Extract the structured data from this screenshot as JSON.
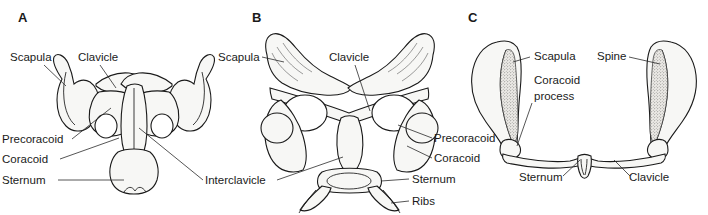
{
  "figure": {
    "background_color": "#ffffff",
    "ink_color": "#1a1a1a",
    "width": 708,
    "height": 215,
    "caption": ""
  },
  "panels": [
    {
      "id": "A",
      "letter": "A",
      "letter_pos": {
        "x": 18,
        "y": 22
      },
      "labels": [
        {
          "name": "scapula",
          "text": "Scapula",
          "x": 10,
          "y": 61,
          "anchor": "start"
        },
        {
          "name": "clavicle",
          "text": "Clavicle",
          "x": 78,
          "y": 61,
          "anchor": "start"
        },
        {
          "name": "precoracoid",
          "text": "Precoracoid",
          "x": 2,
          "y": 143,
          "anchor": "start"
        },
        {
          "name": "coracoid",
          "text": "Coracoid",
          "x": 2,
          "y": 163,
          "anchor": "start"
        },
        {
          "name": "sternum",
          "text": "Sternum",
          "x": 2,
          "y": 184,
          "anchor": "start"
        },
        {
          "name": "interclavicle",
          "text": "Interclavicle",
          "x": 205,
          "y": 184,
          "anchor": "start"
        }
      ]
    },
    {
      "id": "B",
      "letter": "B",
      "letter_pos": {
        "x": 252,
        "y": 22
      },
      "labels": [
        {
          "name": "scapula",
          "text": "Scapula",
          "x": 218,
          "y": 61,
          "anchor": "start"
        },
        {
          "name": "clavicle",
          "text": "Clavicle",
          "x": 329,
          "y": 61,
          "anchor": "start"
        },
        {
          "name": "precoracoid",
          "text": "Precoracoid",
          "x": 434,
          "y": 142,
          "anchor": "start"
        },
        {
          "name": "coracoid",
          "text": "Coracoid",
          "x": 434,
          "y": 162,
          "anchor": "start"
        },
        {
          "name": "sternum",
          "text": "Sternum",
          "x": 412,
          "y": 183,
          "anchor": "start"
        },
        {
          "name": "ribs",
          "text": "Ribs",
          "x": 412,
          "y": 205,
          "anchor": "start"
        },
        {
          "name": "interclavicle",
          "text": "Interclavicle",
          "x": 205,
          "y": 184,
          "anchor": "start"
        }
      ]
    },
    {
      "id": "C",
      "letter": "C",
      "letter_pos": {
        "x": 468,
        "y": 22
      },
      "labels": [
        {
          "name": "scapula",
          "text": "Scapula",
          "x": 534,
          "y": 60,
          "anchor": "start"
        },
        {
          "name": "spine",
          "text": "Spine",
          "x": 597,
          "y": 60,
          "anchor": "start"
        },
        {
          "name": "coracoid-process",
          "text": "Coracoid",
          "x": 534,
          "y": 84,
          "anchor": "start"
        },
        {
          "name": "coracoid-process-line2",
          "text": "process",
          "x": 534,
          "y": 100,
          "anchor": "start"
        },
        {
          "name": "sternum",
          "text": "Sternum",
          "x": 519,
          "y": 181,
          "anchor": "start"
        },
        {
          "name": "clavicle",
          "text": "Clavicle",
          "x": 629,
          "y": 181,
          "anchor": "start"
        }
      ]
    }
  ],
  "illustration": {
    "subject": "pectoral girdle comparative anatomy",
    "view": "ventral",
    "style": "stippled line drawing"
  }
}
